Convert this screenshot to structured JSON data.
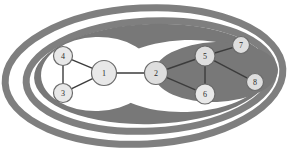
{
  "figure": {
    "name": "hierarchical-cluster-graph",
    "background_color": "#ffffff",
    "band_color": "#7f7f7f",
    "band_color_dark": "#787878",
    "hole_color": "#ffffff",
    "node_fill": "#e8e8e8",
    "node_fill_shaded": "#dedede",
    "node_stroke": "#6b6b6b",
    "edge_color": "#3c3c3c"
  },
  "clusters": [
    {
      "id": "outer-ring",
      "label": "outer cluster ring",
      "cx": 144,
      "cy": 76,
      "rx": 139,
      "ry": 68,
      "rotate": -3,
      "kind": "ring",
      "stroke_width": 7
    },
    {
      "id": "mid-ring",
      "label": "middle cluster ring",
      "cx": 150,
      "cy": 76,
      "rx": 124,
      "ry": 55,
      "rotate": -3,
      "kind": "ring",
      "stroke_width": 7
    },
    {
      "id": "right-blob",
      "label": "right cluster filled region",
      "cx": 152,
      "cy": 74,
      "rx": 118,
      "ry": 50,
      "rotate": -2,
      "kind": "fill"
    },
    {
      "id": "left-hole",
      "label": "left leaf cluster (nodes 1,3,4)",
      "cx": 97,
      "cy": 74,
      "rx": 56,
      "ry": 37,
      "rotate": -2,
      "kind": "hole"
    },
    {
      "id": "right-hole",
      "label": "right leaf cluster (nodes 5,6)",
      "cx": 186,
      "cy": 76,
      "rx": 78,
      "ry": 36,
      "rotate": -2,
      "kind": "hole"
    },
    {
      "id": "right-inner-blob",
      "label": "inner right filled region",
      "cx": 216,
      "cy": 72,
      "rx": 62,
      "ry": 30,
      "rotate": -2,
      "kind": "fill"
    }
  ],
  "graph": {
    "nodes": [
      {
        "id": "1",
        "label": "1",
        "cx": 104,
        "cy": 73,
        "r": 12.5,
        "on_shade": false
      },
      {
        "id": "2",
        "label": "2",
        "cx": 156,
        "cy": 73,
        "r": 11.5,
        "on_shade": true
      },
      {
        "id": "3",
        "label": "3",
        "cx": 63,
        "cy": 93,
        "r": 9.5,
        "on_shade": false
      },
      {
        "id": "4",
        "label": "4",
        "cx": 63,
        "cy": 56,
        "r": 9.5,
        "on_shade": false
      },
      {
        "id": "5",
        "label": "5",
        "cx": 205,
        "cy": 56,
        "r": 10,
        "on_shade": true
      },
      {
        "id": "6",
        "label": "6",
        "cx": 205,
        "cy": 94,
        "r": 10,
        "on_shade": false
      },
      {
        "id": "7",
        "label": "7",
        "cx": 241,
        "cy": 45,
        "r": 8.5,
        "on_shade": true
      },
      {
        "id": "8",
        "label": "8",
        "cx": 255,
        "cy": 82,
        "r": 8.5,
        "on_shade": true
      }
    ],
    "edges": [
      {
        "from": "4",
        "to": "3"
      },
      {
        "from": "4",
        "to": "1"
      },
      {
        "from": "3",
        "to": "1"
      },
      {
        "from": "1",
        "to": "2"
      },
      {
        "from": "2",
        "to": "5"
      },
      {
        "from": "2",
        "to": "6"
      },
      {
        "from": "5",
        "to": "6"
      },
      {
        "from": "5",
        "to": "7"
      },
      {
        "from": "5",
        "to": "8"
      }
    ]
  }
}
